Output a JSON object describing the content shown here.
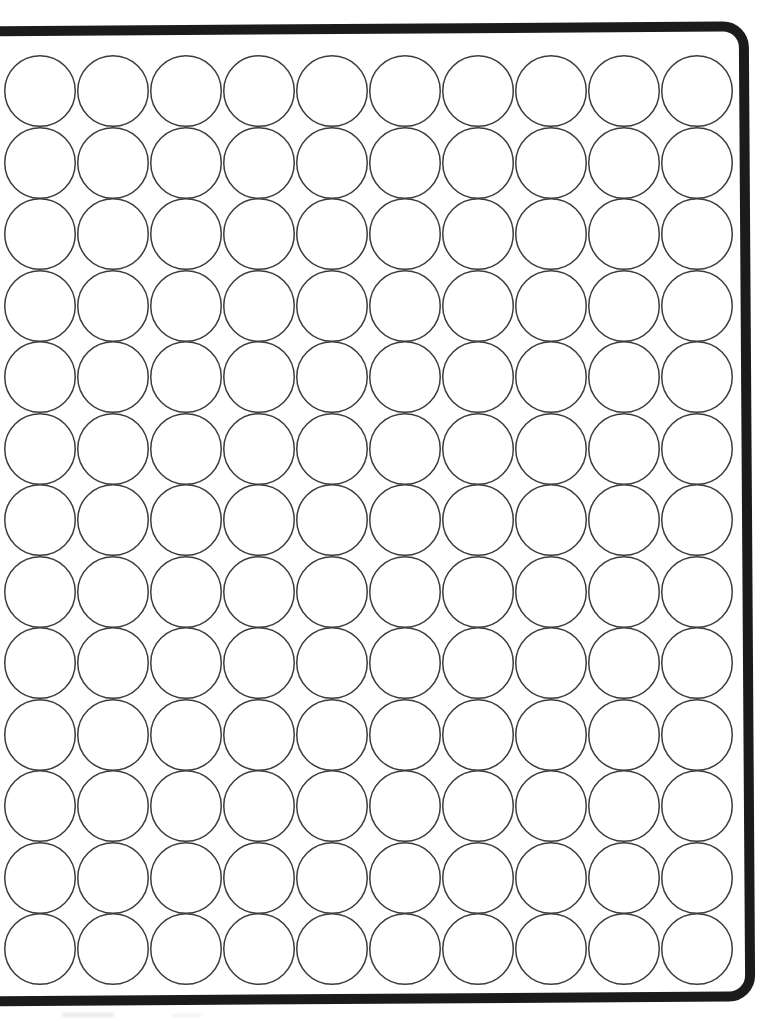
{
  "document": {
    "title": "Blank circle grid worksheet",
    "description": "Scanned printed sheet showing an empty grid of outlined circles inside a thick rounded rectangular border",
    "page_width": 783,
    "page_height": 1021,
    "background_color": "#ffffff"
  },
  "sheet_frame": {
    "name": "sheet-border",
    "stroke_color": "#1b1b1b",
    "stroke_width_px": 10,
    "corner_radius_px": 26,
    "rotation_deg": -0.38,
    "left_edge_cropped": true
  },
  "grid": {
    "rows": 13,
    "columns": 10,
    "total_circles": 130,
    "circle_diameter_px": 72,
    "column_pitch_px": 73,
    "row_pitch_px": 71.5,
    "circle_stroke_color": "#3c3c3c",
    "circle_stroke_width_px": 1.5,
    "circle_fill": "none",
    "origin_x_px": 4,
    "origin_y_px": 55,
    "cells": [
      [
        "",
        "",
        "",
        "",
        "",
        "",
        "",
        "",
        "",
        ""
      ],
      [
        "",
        "",
        "",
        "",
        "",
        "",
        "",
        "",
        "",
        ""
      ],
      [
        "",
        "",
        "",
        "",
        "",
        "",
        "",
        "",
        "",
        ""
      ],
      [
        "",
        "",
        "",
        "",
        "",
        "",
        "",
        "",
        "",
        ""
      ],
      [
        "",
        "",
        "",
        "",
        "",
        "",
        "",
        "",
        "",
        ""
      ],
      [
        "",
        "",
        "",
        "",
        "",
        "",
        "",
        "",
        "",
        ""
      ],
      [
        "",
        "",
        "",
        "",
        "",
        "",
        "",
        "",
        "",
        ""
      ],
      [
        "",
        "",
        "",
        "",
        "",
        "",
        "",
        "",
        "",
        ""
      ],
      [
        "",
        "",
        "",
        "",
        "",
        "",
        "",
        "",
        "",
        ""
      ],
      [
        "",
        "",
        "",
        "",
        "",
        "",
        "",
        "",
        "",
        ""
      ],
      [
        "",
        "",
        "",
        "",
        "",
        "",
        "",
        "",
        "",
        ""
      ],
      [
        "",
        "",
        "",
        "",
        "",
        "",
        "",
        "",
        "",
        ""
      ],
      [
        "",
        "",
        "",
        "",
        "",
        "",
        "",
        "",
        "",
        ""
      ]
    ]
  },
  "artifacts": {
    "smudges": [
      {
        "name": "bottom-left-smudge",
        "color": "#d8d8d8"
      },
      {
        "name": "bottom-left-smudge-2",
        "color": "#d8d8d8"
      }
    ]
  }
}
